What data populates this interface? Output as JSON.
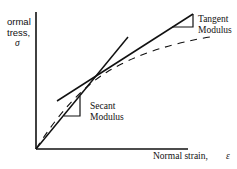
{
  "diagram": {
    "title": "",
    "y_axis": {
      "label_line1": "ormal",
      "label_line2": "tress,",
      "symbol": "σ"
    },
    "x_axis": {
      "label": "Normal strain,",
      "symbol": "ε"
    },
    "annotations": {
      "tangent_line1": "Tangent",
      "tangent_line2": "Modulus",
      "secant_line1": "Secant",
      "secant_line2": "Modulus"
    },
    "curves": [
      {
        "name": "stress-strain-curve",
        "style": "dashed"
      },
      {
        "name": "secant-line",
        "style": "solid"
      },
      {
        "name": "tangent-line",
        "style": "solid"
      }
    ],
    "colors": {
      "line": "#111111",
      "background": "#ffffff"
    }
  }
}
